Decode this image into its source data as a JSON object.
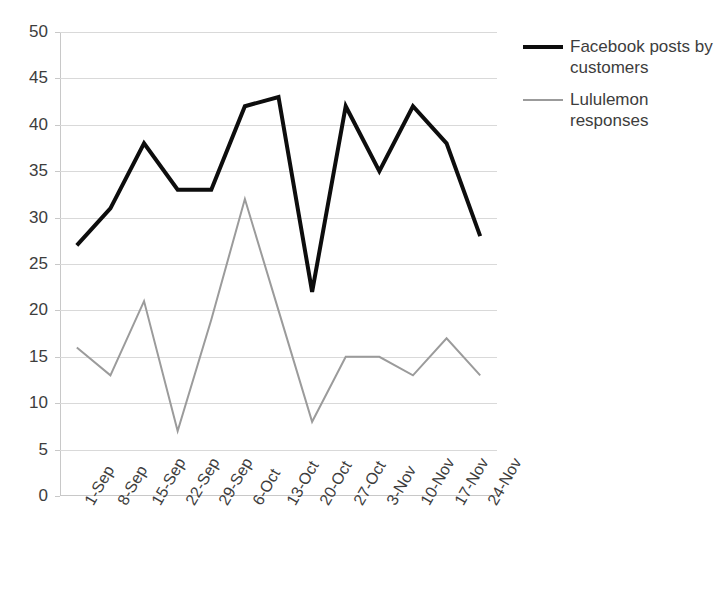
{
  "chart_data": {
    "type": "line",
    "title": "",
    "xlabel": "",
    "ylabel": "",
    "ylim": [
      0,
      50
    ],
    "y_ticks": [
      0,
      5,
      10,
      15,
      20,
      25,
      30,
      35,
      40,
      45,
      50
    ],
    "grid": true,
    "legend_position": "right",
    "categories": [
      "1-Sep",
      "8-Sep",
      "15-Sep",
      "22-Sep",
      "29-Sep",
      "6-Oct",
      "13-Oct",
      "20-Oct",
      "27-Oct",
      "3-Nov",
      "10-Nov",
      "17-Nov",
      "24-Nov"
    ],
    "series": [
      {
        "name": "Facebook posts by customers",
        "color": "#0d0d0d",
        "width": 4,
        "values": [
          27,
          31,
          38,
          33,
          33,
          42,
          43,
          22,
          42,
          35,
          42,
          38,
          28
        ]
      },
      {
        "name": "Lululemon responses",
        "color": "#9b9b9b",
        "width": 2,
        "values": [
          16,
          13,
          21,
          7,
          19,
          32,
          20,
          8,
          15,
          15,
          13,
          17,
          13
        ]
      }
    ]
  },
  "legend": {
    "entries": [
      {
        "label": "Facebook posts by customers",
        "swatch": "thick"
      },
      {
        "label": "Lululemon responses",
        "swatch": "thin"
      }
    ]
  },
  "colors": {
    "series_primary": "#0d0d0d",
    "series_secondary": "#9b9b9b",
    "gridline": "#d9d9d9",
    "axis": "#c8c8c8",
    "text": "#3d3d3d",
    "background": "#ffffff"
  }
}
